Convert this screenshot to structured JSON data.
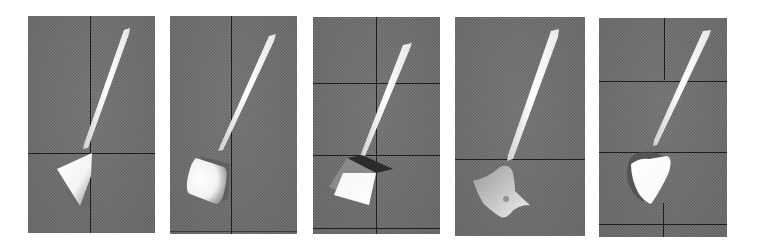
{
  "figure": {
    "panel_count": 5,
    "background_color": "#7c7c7c",
    "gridline_color": "#1e1e1e",
    "object_color": "#ffffff",
    "panels": [
      {
        "index": 1,
        "object": "stick-with-cone-tip",
        "tip_shape": "cone",
        "box": {
          "x": 28,
          "y": 16,
          "w": 127,
          "h": 217
        }
      },
      {
        "index": 2,
        "object": "stick-with-cylinder-tip",
        "tip_shape": "cylinder",
        "box": {
          "x": 170,
          "y": 16,
          "w": 127,
          "h": 218
        }
      },
      {
        "index": 3,
        "object": "stick-with-cube-tip",
        "tip_shape": "cube",
        "box": {
          "x": 313,
          "y": 17,
          "w": 127,
          "h": 217
        }
      },
      {
        "index": 4,
        "object": "stick-with-star-tip",
        "tip_shape": "star",
        "box": {
          "x": 455,
          "y": 17,
          "w": 130,
          "h": 219
        }
      },
      {
        "index": 5,
        "object": "stick-with-rounded-cone-tip",
        "tip_shape": "rounded-cone",
        "box": {
          "x": 599,
          "y": 18,
          "w": 128,
          "h": 219
        }
      }
    ]
  }
}
